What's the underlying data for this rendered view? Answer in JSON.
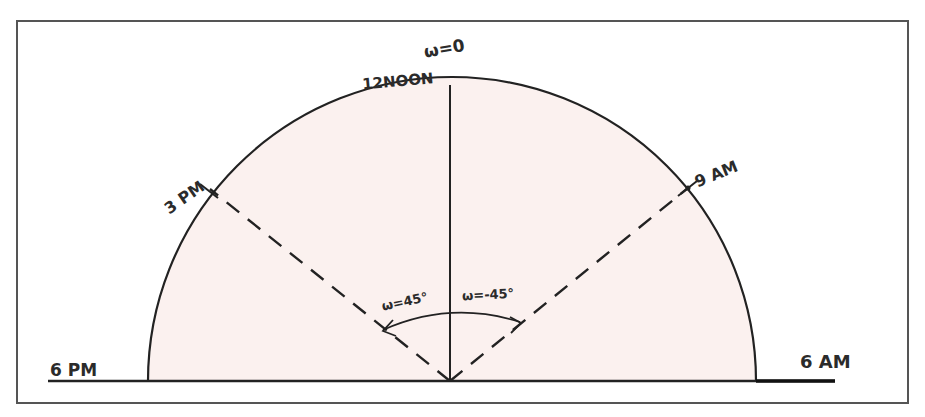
{
  "diagram": {
    "colors": {
      "fill": "#fbf1ef",
      "stroke": "#222222",
      "frame": "#555555"
    },
    "labels": {
      "zenith_angle": "ω=0",
      "noon": "12NOON",
      "afternoon": "3 PM",
      "morning": "9 AM",
      "sunset": "6 PM",
      "sunrise": "6 AM",
      "angle_afternoon": "ω=45°",
      "angle_morning": "ω=-45°"
    },
    "geometry": {
      "center": [
        450,
        381
      ],
      "radius": 302,
      "spokes_deg": [
        -45,
        0,
        45
      ]
    }
  }
}
